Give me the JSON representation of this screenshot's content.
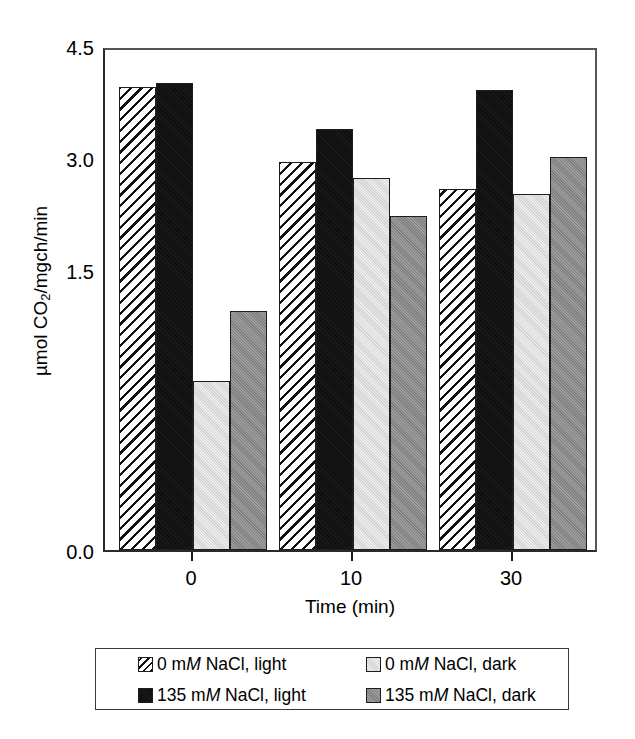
{
  "chart_data": {
    "type": "bar",
    "title": "",
    "xlabel": "Time (min)",
    "ylabel": "µmol CO2/mgch/min",
    "ylabel_parts": {
      "prefix": "µmol CO",
      "sub": "2",
      "suffix": "/mgch/min"
    },
    "categories": [
      "0",
      "10",
      "30"
    ],
    "ylim": [
      0.0,
      4.5
    ],
    "yticks": [
      "4.5",
      "3.0",
      "1.5",
      "0.0"
    ],
    "ytick_values": [
      4.5,
      3.0,
      1.5,
      0.0
    ],
    "grid": false,
    "legend_position": "bottom",
    "series": [
      {
        "name": "0 mM NaCl, light",
        "pattern": "hatch",
        "color": "#ffffff",
        "values": [
          4.13,
          3.46,
          3.22
        ]
      },
      {
        "name": "135 mM NaCl, light",
        "pattern": "solid",
        "color": "#101010",
        "values": [
          4.17,
          3.76,
          4.11
        ]
      },
      {
        "name": "0 mM NaCl, dark",
        "pattern": "solid",
        "color": "#dcdcdc",
        "values": [
          1.51,
          3.32,
          3.18
        ]
      },
      {
        "name": "135 mM NaCl, dark",
        "pattern": "solid",
        "color": "#8a8a8a",
        "values": [
          2.13,
          2.98,
          3.51
        ]
      }
    ]
  },
  "axes": {
    "y_title_prefix": "µmol CO",
    "y_title_sub": "2",
    "y_title_suffix": "/mgch/min",
    "x_title": "Time (min)",
    "y_tick_0": "4.5",
    "y_tick_1": "3.0",
    "y_tick_2": "1.5",
    "y_tick_3": "0.0",
    "x_tick_0": "0",
    "x_tick_1": "10",
    "x_tick_2": "30"
  },
  "legend": {
    "entries": [
      {
        "conc": "0 m",
        "unit": "M",
        "rest": " NaCl, light",
        "swatch": "hatch"
      },
      {
        "conc": "0 m",
        "unit": "M",
        "rest": " NaCl, dark",
        "swatch": "lightgray"
      },
      {
        "conc": "135 m",
        "unit": "M",
        "rest": " NaCl, light",
        "swatch": "black"
      },
      {
        "conc": "135 m",
        "unit": "M",
        "rest": " NaCl, dark",
        "swatch": "darkgray"
      }
    ]
  }
}
